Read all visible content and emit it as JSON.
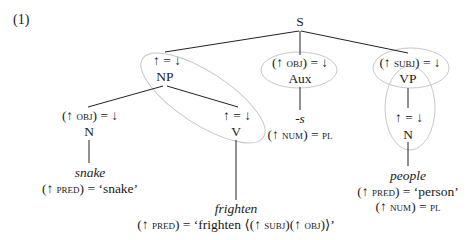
{
  "example_number": "(1)",
  "tree": {
    "root": {
      "label": "S"
    },
    "np": {
      "annotation": "↑ = ↓",
      "label": "NP"
    },
    "aux": {
      "annotation_pre": "(↑ ",
      "annotation_feat": "obj",
      "annotation_post": ") = ↓",
      "label": "Aux",
      "morpheme": "-s",
      "eq_pre": "(↑ ",
      "eq_feat": "num",
      "eq_post": ") = ",
      "eq_val": "pl"
    },
    "vp": {
      "annotation_pre": "(↑ ",
      "annotation_feat": "subj",
      "annotation_post": ") = ↓",
      "label": "VP"
    },
    "n_obj": {
      "annotation_pre": "(↑ ",
      "annotation_feat": "obj",
      "annotation_post": ") = ↓",
      "label": "N",
      "word": "snake",
      "pred_pre": "(↑ ",
      "pred_feat": "pred",
      "pred_post": ") = ‘snake’"
    },
    "v": {
      "annotation": "↑ = ↓",
      "label": "V",
      "word": "frighten",
      "pred_pre": "(↑ ",
      "pred_feat": "pred",
      "pred_mid": ") = ‘frighten ⟨(↑ ",
      "pred_feat2": "subj",
      "pred_mid2": ")(↑ ",
      "pred_feat3": "obj",
      "pred_post": ")⟩’"
    },
    "n_subj": {
      "annotation": "↑ = ↓",
      "label": "N",
      "word": "people",
      "pred_pre": "(↑ ",
      "pred_feat": "pred",
      "pred_post": ") = ‘person’",
      "num_pre": "(↑ ",
      "num_feat": "num",
      "num_post": ") = ",
      "num_val": "pl"
    }
  },
  "colors": {
    "text": "#1a1a1a",
    "lines": "#222222",
    "ellipses": "#c8c8c8"
  }
}
